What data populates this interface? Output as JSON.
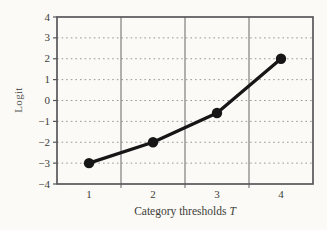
{
  "figure": {
    "background": "#fbfaf6",
    "ylabel": "Logit",
    "xlabel": "Category thresholds",
    "xlabel_var": "T"
  },
  "chart_data": {
    "type": "line",
    "title": "",
    "xlabel": "Category thresholds T",
    "ylabel": "Logit",
    "categories": [
      "1",
      "2",
      "3",
      "4"
    ],
    "values": [
      -3,
      -2,
      -0.6,
      2
    ],
    "ylim": [
      -4,
      4
    ],
    "ytick_step": 1,
    "yticks": [
      -4,
      -3,
      -2,
      -1,
      0,
      1,
      2,
      3,
      4
    ],
    "grid": "horizontal dotted lines at each logit unit; solid vertical category divider lines; full frame border",
    "legend": "none",
    "line_color": "#161616",
    "marker": "filled-circle",
    "marker_radius_px": 5.2,
    "frame_color": "#58565a",
    "divider_color": "#807e7e",
    "dotted_grid_color": "#9b9995",
    "tick_label_color": "#3d3c38"
  }
}
